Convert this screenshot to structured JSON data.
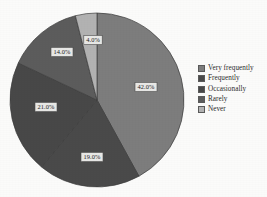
{
  "figure": {
    "background_color": "#fbfbfa",
    "width": 267,
    "height": 197
  },
  "chart_data": {
    "type": "pie",
    "title": "",
    "subtitle": "",
    "xlabel": "",
    "ylabel": "",
    "legend_position": "right",
    "grid": false,
    "start_angle_deg": 0,
    "direction": "clockwise",
    "categories": [
      "Very frequently",
      "Frequently",
      "Occasionally",
      "Rarely",
      "Never"
    ],
    "values": [
      42.0,
      19.0,
      21.0,
      14.0,
      4.0
    ],
    "value_labels": [
      "42.0%",
      "19.0%",
      "21.0%",
      "14.0%",
      "4.0%"
    ],
    "colors": [
      "#7d7d7d",
      "#4a4a4a",
      "#484848",
      "#5c5c5c",
      "#b2b2b2"
    ],
    "slices": [
      {
        "label": "Very frequently",
        "value": 42.0,
        "value_label": "42.0%",
        "color": "#7d7d7d",
        "start_deg": 0.0,
        "end_deg": 151.2,
        "label_x": 146,
        "label_y": 87
      },
      {
        "label": "Frequently",
        "value": 19.0,
        "value_label": "19.0%",
        "color": "#4a4a4a",
        "start_deg": 151.2,
        "end_deg": 219.6,
        "label_x": 92,
        "label_y": 157
      },
      {
        "label": "Occasionally",
        "value": 21.0,
        "value_label": "21.0%",
        "color": "#484848",
        "start_deg": 219.6,
        "end_deg": 295.2,
        "label_x": 46,
        "label_y": 107
      },
      {
        "label": "Rarely",
        "value": 14.0,
        "value_label": "14.0%",
        "color": "#5c5c5c",
        "start_deg": 295.2,
        "end_deg": 345.6,
        "label_x": 62,
        "label_y": 52
      },
      {
        "label": "Never",
        "value": 4.0,
        "value_label": "4.0%",
        "color": "#b2b2b2",
        "start_deg": 345.6,
        "end_deg": 360.0,
        "label_x": 93,
        "label_y": 40
      }
    ],
    "geometry": {
      "center_x": 97,
      "center_y": 100,
      "radius": 87
    }
  },
  "legend": {
    "items": [
      {
        "label": "Very frequently",
        "color": "#7d7d7d"
      },
      {
        "label": "Frequently",
        "color": "#4a4a4a"
      },
      {
        "label": "Occasionally",
        "color": "#484848"
      },
      {
        "label": "Rarely",
        "color": "#5c5c5c"
      },
      {
        "label": "Never",
        "color": "#b2b2b2"
      }
    ]
  }
}
